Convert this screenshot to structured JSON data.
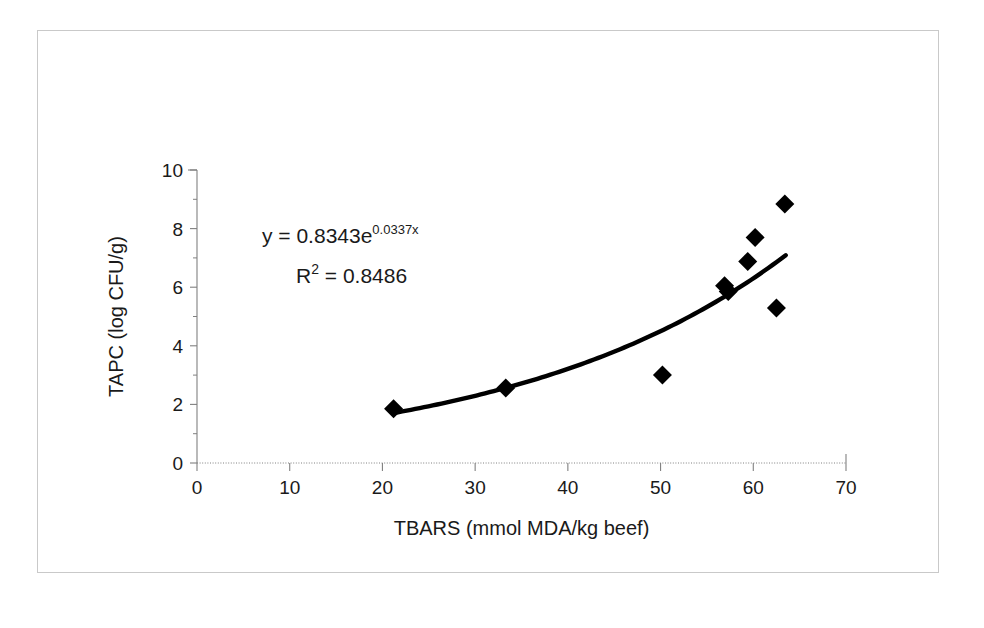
{
  "figure": {
    "background_color": "#ffffff",
    "frame_color": "#c9c9c9",
    "marker_color": "#000000",
    "line_color": "#000000",
    "axis_color": "#808080"
  },
  "annotations": {
    "equation_y": "y = 0.8343e",
    "equation_exponent": "0.0337x",
    "r_label": "R",
    "r_exponent": "2",
    "r_value": "= 0.8486"
  },
  "chart_data": {
    "type": "scatter",
    "title": "",
    "xlabel": "TBARS (mmol MDA/kg beef)",
    "ylabel": "TAPC (log CFU/g)",
    "xlim": [
      0,
      70
    ],
    "ylim": [
      0,
      10
    ],
    "xticks": [
      0,
      10,
      20,
      30,
      40,
      50,
      60,
      70
    ],
    "yticks": [
      0,
      2,
      4,
      6,
      8,
      10
    ],
    "xtick_labels": [
      "0",
      "10",
      "20",
      "30",
      "40",
      "50",
      "60",
      "70"
    ],
    "ytick_labels": [
      "0",
      "2",
      "4",
      "6",
      "8",
      "10"
    ],
    "grid": false,
    "legend": false,
    "marker": "diamond",
    "points": [
      {
        "x": 21.2,
        "y": 1.85
      },
      {
        "x": 33.3,
        "y": 2.56
      },
      {
        "x": 50.2,
        "y": 3.0
      },
      {
        "x": 56.9,
        "y": 6.05
      },
      {
        "x": 57.3,
        "y": 5.85
      },
      {
        "x": 59.4,
        "y": 6.88
      },
      {
        "x": 60.2,
        "y": 7.7
      },
      {
        "x": 62.5,
        "y": 5.29
      },
      {
        "x": 63.4,
        "y": 8.84
      }
    ],
    "trendline": {
      "type": "exponential",
      "equation": "y = 0.8343e^(0.0337x)",
      "coefficient": 0.8343,
      "exponent_rate": 0.0337,
      "r_squared": 0.8486,
      "x_start": 21.2,
      "x_end": 63.5
    }
  }
}
